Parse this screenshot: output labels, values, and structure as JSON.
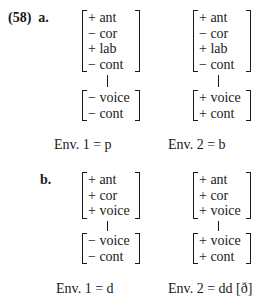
{
  "example": {
    "number": "(58)",
    "parts": [
      {
        "label": "a.",
        "environments": [
          {
            "upper_matrix": [
              "+ ant",
              "− cor",
              "+ lab",
              "− cont"
            ],
            "lower_matrix": [
              "− voice",
              "− cont"
            ],
            "caption": "Env. 1 = p"
          },
          {
            "upper_matrix": [
              "+ ant",
              "− cor",
              "+ lab",
              "− cont"
            ],
            "lower_matrix": [
              "+ voice",
              "+ cont"
            ],
            "caption": "Env. 2 = b"
          }
        ]
      },
      {
        "label": "b.",
        "environments": [
          {
            "upper_matrix": [
              "+ ant",
              "+ cor",
              "+ voice"
            ],
            "lower_matrix": [
              "− voice",
              "− cont"
            ],
            "caption": "Env. 1 = d"
          },
          {
            "upper_matrix": [
              "+ ant",
              "+ cor",
              "+ voice"
            ],
            "lower_matrix": [
              "+ voice",
              "+ cont"
            ],
            "caption": "Env. 2 = dd [ð]"
          }
        ]
      }
    ]
  }
}
